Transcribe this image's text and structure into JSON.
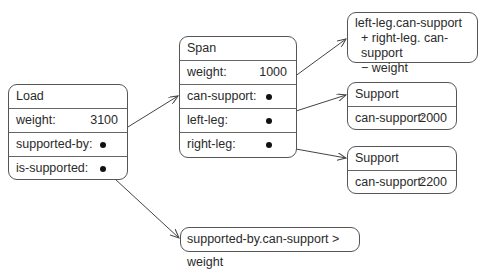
{
  "load": {
    "title": "Load",
    "rows": [
      {
        "label": "weight:",
        "value": "3100"
      },
      {
        "label": "supported-by:",
        "pointer": true
      },
      {
        "label": "is-supported:",
        "pointer": true
      }
    ]
  },
  "span": {
    "title": "Span",
    "rows": [
      {
        "label": "weight:",
        "value": "1000"
      },
      {
        "label": "can-support:",
        "pointer": true
      },
      {
        "label": "left-leg:",
        "pointer": true
      },
      {
        "label": "right-leg:",
        "pointer": true
      }
    ]
  },
  "formula_can_support": {
    "lines": [
      "left-leg.can-support",
      "+ right-leg. can-support",
      "− weight"
    ]
  },
  "support_left": {
    "title": "Support",
    "rows": [
      {
        "label": "can-support:",
        "value": "2000"
      }
    ]
  },
  "support_right": {
    "title": "Support",
    "rows": [
      {
        "label": "can-support:",
        "value": "2200"
      }
    ]
  },
  "formula_is_supported": {
    "text": "supported-by.can-support > weight"
  },
  "colors": {
    "line": "#555555",
    "dot": "#111111",
    "text": "#2a2a2a"
  }
}
